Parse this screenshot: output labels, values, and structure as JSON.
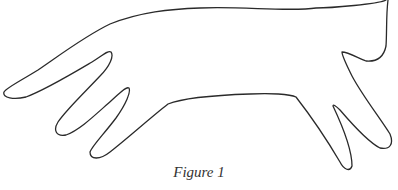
{
  "figure": {
    "caption": "Figure 1",
    "stroke_color": "#2a2a2a",
    "background_color": "#ffffff"
  }
}
